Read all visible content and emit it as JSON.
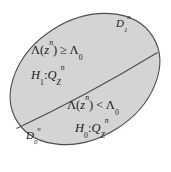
{
  "figure": {
    "type": "decision-region-diagram",
    "background_color": "#ffffff",
    "region": {
      "shape": "ellipse",
      "fill_color": "#d4d4d4",
      "stroke_color": "#4d4d4d",
      "rotation_deg": -32
    },
    "divider": {
      "shape": "curve",
      "stroke_color": "#4d4d4d",
      "description": "boundary separating the two decision regions"
    }
  },
  "labels": {
    "region_upper_name": {
      "base": "D",
      "sub": "1",
      "sup": "n",
      "text": "D₁ⁿ"
    },
    "region_lower_name": {
      "base": "D",
      "sub": "0",
      "sup": "n",
      "text": "D₀ⁿ"
    },
    "upper_test": {
      "lambda": "Λ",
      "arg_open": "(",
      "arg_base": "z",
      "arg_sup": "n",
      "arg_close": ")",
      "relation": "≥",
      "threshold_base": "Λ",
      "threshold_sub": "0",
      "text": "Λ(zⁿ) ≥ Λ₀"
    },
    "upper_hypothesis": {
      "h_base": "H",
      "h_sub": "1",
      "colon": ":",
      "q_base": "Q",
      "q_sub": "Z",
      "q_sup": "n",
      "text": "H₁ : Q_Zⁿ"
    },
    "lower_test": {
      "lambda": "Λ",
      "arg_open": "(",
      "arg_base": "z",
      "arg_sup": "n",
      "arg_close": ")",
      "relation": "<",
      "threshold_base": "Λ",
      "threshold_sub": "0",
      "text": "Λ(zⁿ) < Λ₀"
    },
    "lower_hypothesis": {
      "h_base": "H",
      "h_sub": "0",
      "colon": ":",
      "q_base": "Q",
      "q_sub": "Z",
      "q_sup": "n",
      "text": "H₀ : Q_Zⁿ"
    }
  }
}
